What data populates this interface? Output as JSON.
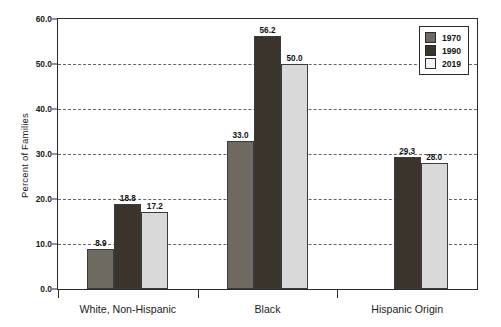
{
  "chart_data": {
    "type": "bar",
    "title": "",
    "xlabel": "",
    "ylabel": "Percent of Families",
    "ylim": [
      0,
      60
    ],
    "ytick_labels": [
      "0.0",
      "10.0",
      "20.0",
      "30.0",
      "40.0",
      "50.0",
      "60.0"
    ],
    "ytick_values": [
      0,
      10,
      20,
      30,
      40,
      50,
      60
    ],
    "grid": "horizontal-dashed",
    "grid_values": [
      10,
      20,
      30,
      40,
      50
    ],
    "legend_position": "top-right",
    "categories": [
      "White, Non-Hispanic",
      "Black",
      "Hispanic Origin"
    ],
    "series": [
      {
        "name": "1970",
        "color": "#6e6961",
        "values": [
          8.9,
          33.0,
          null
        ],
        "labels": [
          "8.9",
          "33.0",
          ""
        ]
      },
      {
        "name": "1990",
        "color": "#3a342d",
        "values": [
          18.8,
          56.2,
          29.3
        ],
        "labels": [
          "18.8",
          "56.2",
          "29.3"
        ]
      },
      {
        "name": "2019",
        "color": "#d9d9d9",
        "values": [
          17.2,
          50.0,
          28.0
        ],
        "labels": [
          "17.2",
          "50.0",
          "28.0"
        ]
      }
    ]
  },
  "legend": {
    "items": [
      {
        "label": "1970"
      },
      {
        "label": "1990"
      },
      {
        "label": "2019"
      }
    ]
  }
}
